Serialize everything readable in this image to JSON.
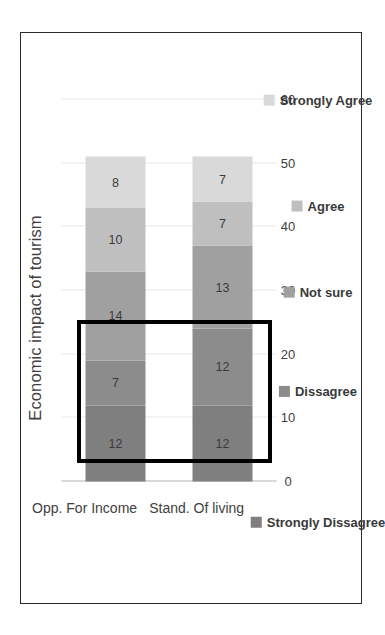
{
  "chart_data": {
    "type": "bar",
    "subtype": "stacked-horizontal",
    "orientation": "rotated-90-ccw",
    "title": "Economic impact of tourism",
    "xlabel": "",
    "ylabel": "",
    "categories": [
      "Opp. For Income",
      "Stand. Of living"
    ],
    "series": [
      {
        "name": "Strongly Dissagree",
        "color": "#7f7f7f",
        "values": [
          12,
          12
        ]
      },
      {
        "name": "Dissagree",
        "color": "#8c8c8c",
        "values": [
          7,
          12
        ]
      },
      {
        "name": "Not sure",
        "color": "#a0a0a0",
        "values": [
          14,
          13
        ]
      },
      {
        "name": "Agree",
        "color": "#bfbfbf",
        "values": [
          10,
          7
        ]
      },
      {
        "name": "Strongly Agree",
        "color": "#d9d9d9",
        "values": [
          8,
          7
        ]
      }
    ],
    "totals": [
      51,
      51
    ],
    "value_axis": {
      "ticks": [
        0,
        10,
        20,
        30,
        40,
        50,
        60
      ],
      "min": 0,
      "max": 60,
      "grid": true
    },
    "legend": {
      "position": "bottom",
      "entries": [
        "Strongly Dissagree",
        "Dissagree",
        "Not sure",
        "Agree",
        "Strongly Agree"
      ]
    },
    "annotation": {
      "type": "highlight-rectangle",
      "color": "#000000",
      "covers_value_range": [
        0,
        20
      ],
      "description": "Black rectangle highlighting the 0-20 portion of both bars"
    }
  },
  "frame": {
    "border_color": "#2b2b2b"
  }
}
